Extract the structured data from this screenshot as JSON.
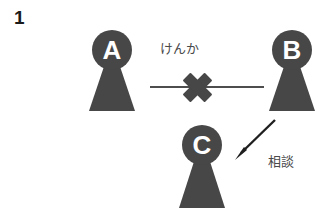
{
  "figure": {
    "number": "1",
    "background_color": "#ffffff",
    "figure_fill_color": "#474747",
    "label_text_color": "#4a4a4a",
    "number_text_color": "#1a1a1a",
    "width": 324,
    "height": 221
  },
  "people": [
    {
      "id": "a",
      "letter": "A",
      "icon": "person-keyhole-icon",
      "position": {
        "x": 86,
        "y": 28
      }
    },
    {
      "id": "b",
      "letter": "B",
      "icon": "person-keyhole-icon",
      "position": {
        "x": 266,
        "y": 28
      }
    },
    {
      "id": "c",
      "letter": "C",
      "icon": "person-keyhole-icon",
      "position": {
        "x": 176,
        "y": 123
      }
    }
  ],
  "relations": [
    {
      "id": "conflict",
      "label": "けんか",
      "icon": "cross-mark-icon",
      "from": "A",
      "to": "B",
      "style": "line-with-cross"
    },
    {
      "id": "advice",
      "label": "相談",
      "icon": "arrow-down-left-icon",
      "from": "B",
      "to": "C",
      "style": "arrow"
    }
  ]
}
